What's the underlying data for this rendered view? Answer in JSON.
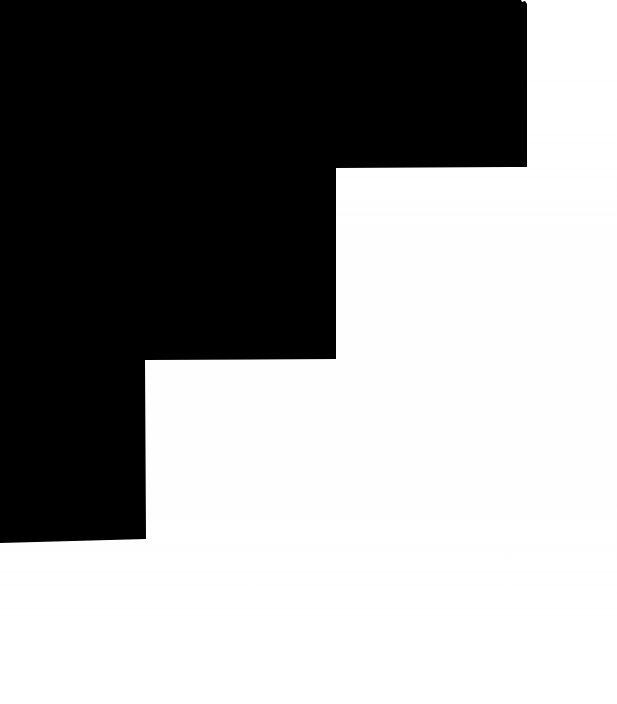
{
  "image": {
    "title": "Black staircase silhouette",
    "description": "A solid black descending staircase shape occupying the upper-left of a plain white field",
    "width": 617,
    "height": 704,
    "background_color": "#ffffff",
    "shape_color": "#000000",
    "orientation": "portrait",
    "style": "high-contrast two-tone silhouette"
  },
  "shape": {
    "name": "staircase-silhouette",
    "fill": "#000000",
    "step_count": 3,
    "direction": "descending-left-to-right",
    "outline_points": "0,0 521,0 522,2 525,1 527,4 527,167 336,168 336,359 145,360 146,539 0,543",
    "steps": [
      {
        "index": 1,
        "label": "top-step",
        "x_start": 0,
        "x_end": 527,
        "y_start": 0,
        "y_end": 167,
        "width": 527,
        "height": 167
      },
      {
        "index": 2,
        "label": "middle-step",
        "x_start": 0,
        "x_end": 336,
        "y_start": 167,
        "y_end": 359,
        "width": 336,
        "height": 192
      },
      {
        "index": 3,
        "label": "bottom-step",
        "x_start": 0,
        "x_end": 145,
        "y_start": 359,
        "y_end": 541,
        "width": 145,
        "height": 182
      }
    ],
    "notch": {
      "name": "top-right-corner-notch",
      "x": 521,
      "y": 0,
      "width": 6,
      "height": 8
    }
  },
  "regions": [
    {
      "name": "white-field-right",
      "color": "#ffffff",
      "x": 527,
      "y": 0,
      "width": 90,
      "height": 704
    },
    {
      "name": "white-field-middle",
      "color": "#ffffff",
      "x": 336,
      "y": 167,
      "width": 281,
      "height": 192
    },
    {
      "name": "white-field-lower",
      "color": "#ffffff",
      "x": 0,
      "y": 541,
      "width": 617,
      "height": 163
    }
  ]
}
